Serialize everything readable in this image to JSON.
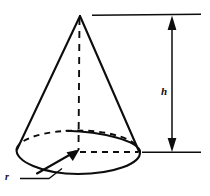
{
  "figure": {
    "kind": "geometry-diagram",
    "background_color": "#ffffff",
    "line_color": "#0d0d0d"
  },
  "labels": {
    "height": "h",
    "radius": "r"
  },
  "geometry": {
    "apex": {
      "x": 80,
      "y": 16
    },
    "base_center": {
      "x": 78,
      "y": 152
    },
    "base_rx": 62,
    "base_ry": 22,
    "left_base_point": {
      "x": 17,
      "y": 150
    },
    "right_base_point": {
      "x": 139,
      "y": 152
    },
    "axis": {
      "from_y": 18,
      "to_y": 150
    },
    "radius_arrow": {
      "tip_x": 76,
      "tip_y": 151,
      "tail_x": 38,
      "tail_y": 173
    },
    "radius_dashed": {
      "from_x": 80,
      "from_y": 152,
      "to_x": 139,
      "to_y": 152
    }
  },
  "dimension": {
    "top_extension_line": {
      "x1": 92,
      "x2": 201,
      "y": 15
    },
    "bottom_extension_line": {
      "x1": 142,
      "x2": 201,
      "y": 152
    },
    "arrow_x": 172,
    "arrow_top_y": 17,
    "arrow_bottom_y": 150,
    "label_position": {
      "x": 166,
      "y": 92
    }
  }
}
